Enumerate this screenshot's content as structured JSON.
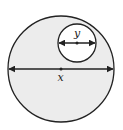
{
  "diagram": {
    "type": "nested-circles",
    "large_circle": {
      "label": "x",
      "fill": "#ececec",
      "stroke": "#222222",
      "cx": 61,
      "cy": 69,
      "r": 53
    },
    "small_circle": {
      "label": "y",
      "fill": "#ffffff",
      "stroke": "#222222",
      "cx": 77,
      "cy": 43,
      "r": 19
    },
    "labels": {
      "large_diameter": "x",
      "small_diameter": "y"
    }
  }
}
